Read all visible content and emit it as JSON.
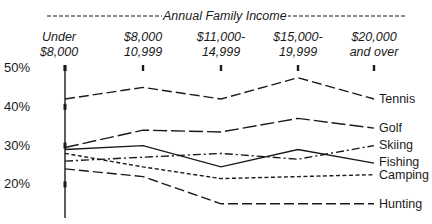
{
  "chart_data": {
    "type": "line",
    "title": "Annual Family Income",
    "xlabel": "Annual Family Income",
    "ylabel": "",
    "categories": [
      "Under $8,000",
      "$8,000-10,999",
      "$11,000-14,999",
      "$15,000-19,999",
      "$20,000 and over"
    ],
    "category_lines": [
      [
        "Under",
        "$8,000"
      ],
      [
        "$8,000",
        "10,999"
      ],
      [
        "$11,000-",
        "14,999"
      ],
      [
        "$15,000-",
        "19,999"
      ],
      [
        "$20,000",
        "and over"
      ]
    ],
    "yticks": [
      {
        "value": 50,
        "label": "50%"
      },
      {
        "value": 40,
        "label": "40%"
      },
      {
        "value": 30,
        "label": "30%"
      },
      {
        "value": 20,
        "label": "20%"
      }
    ],
    "ylim": [
      12,
      50
    ],
    "grid": false,
    "legend_position": "right (direct line labels)",
    "series": [
      {
        "name": "Tennis",
        "style": "long-dash",
        "values": [
          42,
          45,
          42,
          47.5,
          42
        ]
      },
      {
        "name": "Golf",
        "style": "dash-solid",
        "values": [
          29.5,
          34,
          33.5,
          37,
          34.5
        ]
      },
      {
        "name": "Skiing",
        "style": "dash-dot",
        "values": [
          26,
          27,
          28,
          26.5,
          30
        ]
      },
      {
        "name": "Fishing",
        "style": "solid",
        "values": [
          29,
          30,
          24.5,
          29,
          25.5
        ]
      },
      {
        "name": "Camping",
        "style": "short-dash",
        "values": [
          28,
          24.5,
          21.5,
          22,
          22.5
        ]
      },
      {
        "name": "Hunting",
        "style": "long-dash",
        "values": [
          24,
          22,
          15,
          15,
          15
        ]
      }
    ]
  },
  "header": {
    "title": "Annual Family Income"
  },
  "colors": {
    "ink": "#1a1a1a",
    "background": "#ffffff"
  }
}
